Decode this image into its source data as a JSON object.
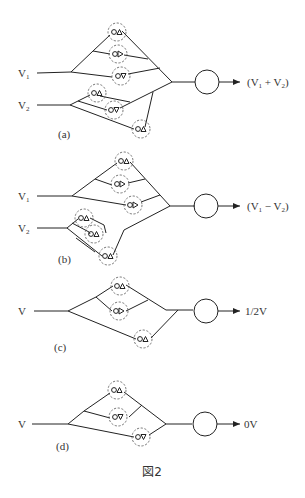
{
  "figure": {
    "caption": "図2",
    "panels": [
      {
        "id": "a",
        "label": "(a)",
        "inputs": [
          {
            "name": "V",
            "sub": "1"
          },
          {
            "name": "V",
            "sub": "2"
          }
        ],
        "output": {
          "pre": "(V",
          "sub1": "1",
          "op": " + V",
          "sub2": "2",
          "post": ")"
        }
      },
      {
        "id": "b",
        "label": "(b)",
        "inputs": [
          {
            "name": "V",
            "sub": "1"
          },
          {
            "name": "V",
            "sub": "2"
          }
        ],
        "output": {
          "pre": "(V",
          "sub1": "1",
          "op": " − V",
          "sub2": "2",
          "post": ")"
        }
      },
      {
        "id": "c",
        "label": "(c)",
        "inputs": [
          {
            "name": "V"
          }
        ],
        "output": {
          "text": "1/2V"
        }
      },
      {
        "id": "d",
        "label": "(d)",
        "inputs": [
          {
            "name": "V"
          }
        ],
        "output": {
          "text": "0V"
        }
      }
    ]
  },
  "colors": {
    "stroke": "#222222",
    "dashed": "#555555",
    "text": "#333333",
    "background": "#ffffff"
  }
}
